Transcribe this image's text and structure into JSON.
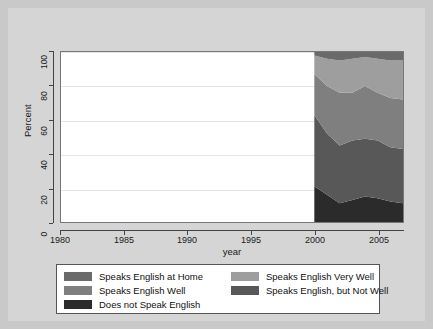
{
  "chart_data": {
    "type": "area",
    "title": "",
    "xlabel": "year",
    "ylabel": "Percent",
    "xlim": [
      1980,
      2007
    ],
    "ylim": [
      0,
      100
    ],
    "grid": true,
    "stacked": true,
    "legend_position": "bottom",
    "x": [
      2000,
      2001,
      2002,
      2003,
      2004,
      2005,
      2006,
      2007
    ],
    "xticks": [
      "1980",
      "1985",
      "1990",
      "1995",
      "2000",
      "2005"
    ],
    "xtick_values": [
      1980,
      1985,
      1990,
      1995,
      2000,
      2005
    ],
    "yticks": [
      "0",
      "20",
      "40",
      "60",
      "80",
      "100"
    ],
    "ytick_values": [
      0,
      20,
      40,
      60,
      80,
      100
    ],
    "series": [
      {
        "name": "Does not Speak English",
        "color": "#2b2b2b",
        "values": [
          21,
          16,
          11,
          13,
          15,
          14,
          12,
          11
        ]
      },
      {
        "name": "Speaks English, but Not Well",
        "color": "#585858",
        "values": [
          42,
          36,
          34,
          35,
          34,
          34,
          32,
          32
        ]
      },
      {
        "name": "Speaks English Well",
        "color": "#7f7f7f",
        "values": [
          24,
          28,
          31,
          28,
          31,
          28,
          29,
          29
        ]
      },
      {
        "name": "Speaks English Very Well",
        "color": "#9e9e9e",
        "values": [
          11,
          16,
          19,
          20,
          17,
          20,
          22,
          23
        ]
      },
      {
        "name": "Speaks English at Home",
        "color": "#6a6a6a",
        "values": [
          2,
          4,
          5,
          4,
          3,
          4,
          5,
          5
        ]
      }
    ]
  },
  "axes": {
    "y_title": "Percent",
    "x_title": "year",
    "y_tick_labels": [
      "0",
      "20",
      "40",
      "60",
      "80",
      "100"
    ],
    "x_tick_labels": [
      "1980",
      "1985",
      "1990",
      "1995",
      "2000",
      "2005"
    ]
  },
  "legend": {
    "left_column": [
      {
        "label": "Speaks English at Home",
        "color": "#6a6a6a"
      },
      {
        "label": "Speaks English Well",
        "color": "#7f7f7f"
      },
      {
        "label": "Does not Speak English",
        "color": "#2b2b2b"
      }
    ],
    "right_column": [
      {
        "label": "Speaks English Very Well",
        "color": "#9e9e9e"
      },
      {
        "label": "Speaks English, but Not Well",
        "color": "#585858"
      }
    ]
  },
  "colors": {
    "figure_background": "#d5d5d5",
    "page_background": "#c9c9c9",
    "plot_background": "#ffffff",
    "gridline": "#e4e4e4",
    "axis": "#444444",
    "text": "#1a1a1a"
  }
}
